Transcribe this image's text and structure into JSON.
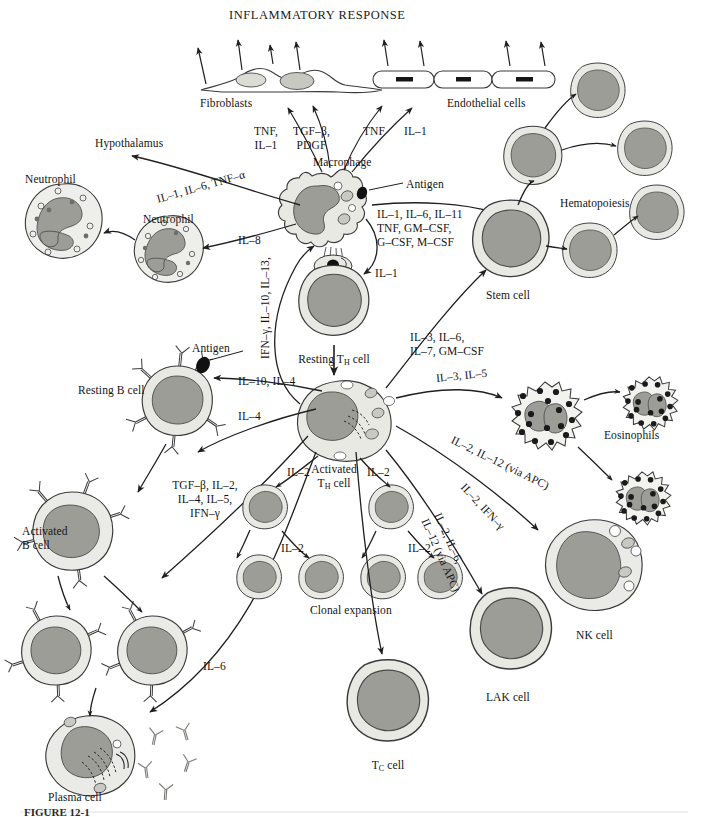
{
  "figure": {
    "title": "INFLAMMATORY RESPONSE",
    "caption": "FIGURE 12-1"
  },
  "colors": {
    "cytoplasm": "#e9e9e4",
    "cytoplasm_dark": "#dededa",
    "nucleus": "#9d9d97",
    "outline": "#333333",
    "granule": "#2a2a2a",
    "text": "#141414",
    "background": "#ffffff"
  },
  "cell_labels": {
    "fibroblasts": "Fibroblasts",
    "endothelial": "Endothelial cells",
    "macrophage": "Macrophage",
    "hypothalamus": "Hypothalamus",
    "neutrophil_left": "Neutrophil",
    "neutrophil_right": "Neutrophil",
    "antigen_macrophage": "Antigen",
    "antigen_bcell": "Antigen",
    "stem_cell": "Stem cell",
    "hematopoiesis": "Hematopoiesis",
    "resting_th": "Resting T",
    "resting_th_sub": "H",
    "resting_th_tail": " cell",
    "activated_th_l1": "Activated",
    "activated_th_l2": "T",
    "activated_th_sub": "H",
    "activated_th_tail": " cell",
    "resting_b": "Resting B cell",
    "activated_b_l1": "Activated",
    "activated_b_l2": "B cell",
    "plasma_cell": "Plasma cell",
    "clonal_expansion": "Clonal expansion",
    "eosinophils": "Eosinophils",
    "nk_cell": "NK cell",
    "lak_cell": "LAK cell",
    "tc_cell": "T",
    "tc_cell_sub": "C",
    "tc_cell_tail": " cell"
  },
  "cytokine_labels": {
    "to_fibroblast_a_l1": "TNF,",
    "to_fibroblast_a_l2": "IL–1",
    "to_fibroblast_b_l1": "TGF–β,",
    "to_fibroblast_b_l2": "PDGF",
    "to_endothelial_a": "TNF",
    "to_endothelial_b": "IL–1",
    "to_hypothalamus": "IL–1, IL–6, TNF–α",
    "to_neutrophil": "IL–8",
    "to_stem_l1": "IL–1, IL–6, IL–11",
    "to_stem_l2": "TNF, GM–CSF,",
    "to_stem_l3": "G–CSF, M–CSF",
    "macrophage_to_th": "IL–1",
    "th_to_macrophage": "IFN–γ, IL–10, IL–13,",
    "th_to_stem_l1": "IL–3, IL–6,",
    "th_to_stem_l2": "IL–7, GM–CSF",
    "th_to_bcell_a": "IL–10, IL–4",
    "th_to_bcell_b": "IL–4",
    "to_plasma_l1": "TGF–β, IL–2,",
    "to_plasma_l2": "IL–4, IL–5,",
    "to_plasma_l3": "IFN–γ",
    "to_eosinophil": "IL–3, IL–5",
    "to_nk": "IL–2, IL–12 (via APC)",
    "to_lak": "IL–2, IFN–γ",
    "to_tc_l1": "IL–2, IL–6,",
    "to_tc_l2": "IL–12 (via APC)",
    "clonal_il2_left": "IL–2",
    "clonal_il2_right": "IL–2",
    "clonal_il2_row2_left": "IL–2",
    "clonal_il2_row2_right": "IL–2",
    "to_plasma_il6": "IL–6"
  }
}
